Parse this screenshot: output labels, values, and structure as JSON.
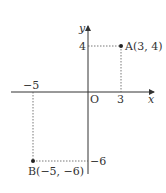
{
  "diagram": {
    "type": "coordinate-plane",
    "axes": {
      "x_label": "x",
      "y_label": "y",
      "origin_label": "O"
    },
    "ticks": {
      "x_pos": "3",
      "x_neg": "−5",
      "y_pos": "4",
      "y_neg": "−6"
    },
    "points": [
      {
        "name": "A",
        "label": "A(3, 4)",
        "x": 3,
        "y": 4
      },
      {
        "name": "B",
        "label": "B(−5, −6)",
        "x": -5,
        "y": -6
      }
    ],
    "colors": {
      "line": "#333333",
      "dotted": "#555555",
      "background": "#ffffff"
    }
  }
}
